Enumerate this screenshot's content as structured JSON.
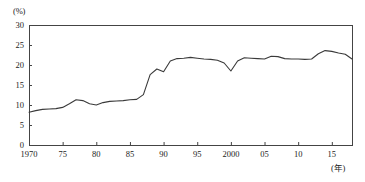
{
  "chart_data": {
    "type": "line",
    "title": "",
    "xlabel": "(年)",
    "ylabel": "(%)",
    "xlim": [
      1970,
      2018
    ],
    "ylim": [
      0,
      30
    ],
    "grid": false,
    "legend": "none",
    "yticks": [
      0,
      5,
      10,
      15,
      20,
      25,
      30
    ],
    "ytick_labels": [
      "0",
      "5",
      "10",
      "15",
      "20",
      "25",
      "30"
    ],
    "xticks": [
      1970,
      1975,
      1980,
      1985,
      1990,
      1995,
      2000,
      2005,
      2010,
      2015
    ],
    "xtick_labels": [
      "1970",
      "75",
      "80",
      "85",
      "90",
      "95",
      "2000",
      "05",
      "10",
      "15"
    ],
    "x": [
      1970,
      1971,
      1972,
      1973,
      1974,
      1975,
      1976,
      1977,
      1978,
      1979,
      1980,
      1981,
      1982,
      1983,
      1984,
      1985,
      1986,
      1987,
      1988,
      1989,
      1990,
      1991,
      1992,
      1993,
      1994,
      1995,
      1996,
      1997,
      1998,
      1999,
      2000,
      2001,
      2002,
      2003,
      2004,
      2005,
      2006,
      2007,
      2008,
      2009,
      2010,
      2011,
      2012,
      2013,
      2014,
      2015,
      2016,
      2017,
      2018
    ],
    "values": [
      8.2,
      8.6,
      8.9,
      9.0,
      9.1,
      9.4,
      10.3,
      11.3,
      11.1,
      10.3,
      10.0,
      10.6,
      10.9,
      11.0,
      11.1,
      11.3,
      11.4,
      12.6,
      17.6,
      19.0,
      18.3,
      21.0,
      21.6,
      21.7,
      21.9,
      21.7,
      21.5,
      21.4,
      21.2,
      20.5,
      18.5,
      21.0,
      21.8,
      21.7,
      21.6,
      21.5,
      22.2,
      22.1,
      21.6,
      21.5,
      21.5,
      21.4,
      21.5,
      22.8,
      23.6,
      23.4,
      23.0,
      22.7,
      21.5
    ],
    "series": [
      {
        "name": "percentage",
        "color": "#3a3a3a",
        "values": [
          8.2,
          8.6,
          8.9,
          9.0,
          9.1,
          9.4,
          10.3,
          11.3,
          11.1,
          10.3,
          10.0,
          10.6,
          10.9,
          11.0,
          11.1,
          11.3,
          11.4,
          12.6,
          17.6,
          19.0,
          18.3,
          21.0,
          21.6,
          21.7,
          21.9,
          21.7,
          21.5,
          21.4,
          21.2,
          20.5,
          18.5,
          21.0,
          21.8,
          21.7,
          21.6,
          21.5,
          22.2,
          22.1,
          21.6,
          21.5,
          21.5,
          21.4,
          21.5,
          22.8,
          23.6,
          23.4,
          23.0,
          22.7,
          21.5
        ]
      }
    ],
    "plot_box": {
      "left": 29,
      "top": 25,
      "right": 352,
      "bottom": 145
    },
    "axis_color": "#444444",
    "line_color": "#3a3a3a"
  }
}
